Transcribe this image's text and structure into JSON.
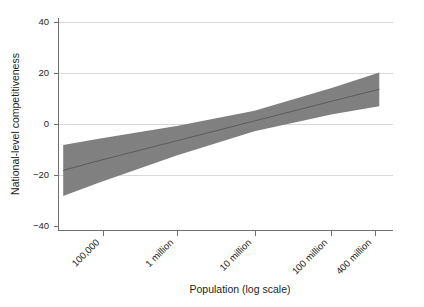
{
  "chart_data": {
    "type": "line",
    "title": "",
    "subtitle": "",
    "xlabel": "Population (log scale)",
    "ylabel": "National-level competitiveness",
    "grid": true,
    "legend": null,
    "x_scale": "log",
    "xlim": [
      30000,
      600000000
    ],
    "ylim": [
      -40,
      40
    ],
    "y_ticks": [
      40,
      20,
      0,
      -20,
      -40
    ],
    "y_tick_labels": [
      "40",
      "20",
      "0",
      "−20",
      "−40"
    ],
    "x_ticks": [
      100000,
      1000000,
      10000000,
      100000000,
      400000000
    ],
    "x_tick_labels": [
      "100,000",
      "1 million",
      "10 million",
      "100 million",
      "400 million"
    ],
    "x_tick_rotation_deg": -45,
    "series": [
      {
        "name": "Fitted regression line",
        "kind": "line",
        "color": "#5b5b5b",
        "x": [
          35000,
          100000,
          1000000,
          10000000,
          100000000,
          400000000
        ],
        "values": [
          -18.0,
          -14.2,
          -6.4,
          1.4,
          9.2,
          13.8
        ]
      },
      {
        "name": "95% confidence band",
        "kind": "band",
        "color": "#808080",
        "x": [
          35000,
          100000,
          1000000,
          10000000,
          100000000,
          400000000
        ],
        "upper": [
          -8.0,
          -5.6,
          -0.6,
          5.4,
          14.4,
          20.4
        ],
        "lower": [
          -28.0,
          -22.8,
          -12.2,
          -2.6,
          4.0,
          7.2
        ]
      }
    ],
    "annotations": []
  },
  "figure": {
    "background_color": "#ffffff",
    "band_color": "#808080",
    "line_color": "#5b5b5b",
    "grid_color": "#d9d9d9",
    "axis_color": "#6f6f6f",
    "text_color": "#231f20"
  }
}
